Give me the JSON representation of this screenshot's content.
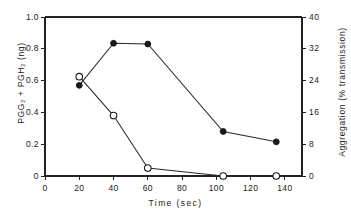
{
  "chart_data": {
    "type": "line",
    "title": "",
    "xlabel": "Time (sec)",
    "ylabel": "PGG₂ + PGH₂ (ng)",
    "ylabel_right": "Aggregation (% transmission)",
    "xlim": [
      0,
      150
    ],
    "ylim": [
      0,
      1.0
    ],
    "ylim_right": [
      0,
      40
    ],
    "grid": false,
    "legend": "none",
    "xticks": [
      0,
      20,
      40,
      60,
      80,
      100,
      120,
      140
    ],
    "xtick_labels": [
      "0",
      "20",
      "40",
      "60",
      "80",
      "100",
      "120",
      "140"
    ],
    "yticks": [
      0,
      0.2,
      0.4,
      0.6,
      0.8,
      1.0
    ],
    "ytick_labels": [
      "0",
      "0.2",
      "0.4",
      "0.6",
      "0.8",
      "1.0"
    ],
    "yticks_right": [
      0,
      8,
      16,
      24,
      32,
      40
    ],
    "ytick_labels_right": [
      "0",
      "8",
      "16",
      "24",
      "32",
      "40"
    ],
    "series": [
      {
        "name": "PGG2 + PGH2",
        "marker": "filled-circle",
        "axis": "left",
        "x": [
          20,
          40,
          60,
          104,
          135
        ],
        "values": [
          0.57,
          0.835,
          0.83,
          0.28,
          0.215
        ]
      },
      {
        "name": "Aggregation",
        "marker": "open-circle",
        "axis": "right",
        "x": [
          20,
          40,
          60,
          104,
          135
        ],
        "values": [
          25.0,
          15.2,
          2.0,
          0.0,
          0.0
        ]
      }
    ]
  },
  "figure": {
    "background_color": "#ffffff",
    "axis_color": "#222222",
    "series_color": "#1a1a1a"
  }
}
